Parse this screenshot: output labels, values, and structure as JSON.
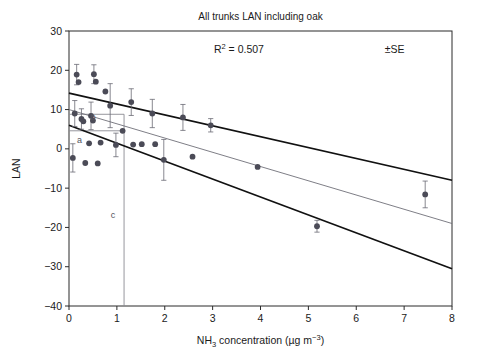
{
  "chart_data": {
    "type": "scatter",
    "title": "All trunks LAN including oak",
    "xlabel": "NH3 concentration (µg m-3)",
    "xlabel_parts": {
      "pre": "NH",
      "sub": "3",
      "mid": " concentration (µg m",
      "sup": "−3",
      "post": ")"
    },
    "ylabel": "LAN",
    "xlim": [
      0,
      8
    ],
    "ylim": [
      -40,
      30
    ],
    "xticks": [
      0,
      1,
      2,
      3,
      4,
      5,
      6,
      7,
      8
    ],
    "yticks": [
      -40,
      -30,
      -20,
      -10,
      0,
      10,
      20,
      30
    ],
    "xtick_labels": [
      "0",
      "1",
      "2",
      "3",
      "4",
      "5",
      "6",
      "7",
      "8"
    ],
    "ytick_labels": [
      "−40",
      "−30",
      "−20",
      "−10",
      "0",
      "10",
      "20",
      "30"
    ],
    "grid": false,
    "legend": false,
    "annotations": [
      {
        "name": "r-squared",
        "text": "R2 = 0.507",
        "text_pre": "R",
        "text_sup": "2",
        "text_post": "= 0.507",
        "x": 3.55,
        "y": 24.5
      },
      {
        "name": "se-note",
        "text": "±SE",
        "x": 6.8,
        "y": 24.5
      }
    ],
    "marker_labels": [
      {
        "name": "marker-a",
        "label": "a",
        "x": 0.22,
        "y": 1.6
      },
      {
        "name": "marker-b",
        "label": "b",
        "x": 0.5,
        "y": 7.3
      },
      {
        "name": "marker-c",
        "label": "c",
        "x": 0.92,
        "y": -17.5
      }
    ],
    "reference_lines": [
      {
        "name": "ref-line-a-horizontal",
        "kind": "horizontal",
        "y": 4.6,
        "x0": 0.0,
        "x1": 1.15,
        "color": "#8a8a92"
      },
      {
        "name": "ref-line-b-horizontal",
        "kind": "horizontal",
        "y": 8.8,
        "x0": 0.0,
        "x1": 1.15,
        "color": "#8a8a92"
      },
      {
        "name": "ref-line-c-vertical",
        "kind": "vertical",
        "x": 1.15,
        "y0": -40.0,
        "y1": 8.8,
        "color": "#8a8a92"
      }
    ],
    "fit_lines": [
      {
        "name": "upper-confidence-line",
        "style": "solid-thick",
        "color": "#111111",
        "x0": 0.0,
        "y0": 14.2,
        "x1": 8.0,
        "y1": -8.0
      },
      {
        "name": "regression-line",
        "style": "solid-thin",
        "color": "#6f6f78",
        "x0": 0.0,
        "y0": 10.0,
        "x1": 8.0,
        "y1": -19.0
      },
      {
        "name": "lower-confidence-line",
        "style": "solid-thick",
        "color": "#111111",
        "x0": 0.0,
        "y0": 6.0,
        "x1": 8.0,
        "y1": -30.5
      }
    ],
    "marker_color": "#4b4b57",
    "errorbar_color": "#6a6a74",
    "points": [
      {
        "x": 0.08,
        "y": -2.3,
        "err": 3.6
      },
      {
        "x": 0.12,
        "y": 9.0,
        "err": 3.3
      },
      {
        "x": 0.16,
        "y": 18.9,
        "err": 2.6
      },
      {
        "x": 0.2,
        "y": 17.0,
        "err": 0.0
      },
      {
        "x": 0.26,
        "y": 7.6,
        "err": 2.6
      },
      {
        "x": 0.3,
        "y": 7.0,
        "err": 0.0
      },
      {
        "x": 0.34,
        "y": -3.6,
        "err": 0.0
      },
      {
        "x": 0.42,
        "y": 1.4,
        "err": 0.0
      },
      {
        "x": 0.46,
        "y": 8.4,
        "err": 3.5
      },
      {
        "x": 0.5,
        "y": 7.2,
        "err": 0.0
      },
      {
        "x": 0.52,
        "y": 19.0,
        "err": 2.4
      },
      {
        "x": 0.56,
        "y": 17.1,
        "err": 0.0
      },
      {
        "x": 0.6,
        "y": -3.7,
        "err": 0.0
      },
      {
        "x": 0.66,
        "y": 1.6,
        "err": 0.0
      },
      {
        "x": 0.76,
        "y": 14.6,
        "err": 0.0
      },
      {
        "x": 0.86,
        "y": 11.0,
        "err": 5.6
      },
      {
        "x": 0.98,
        "y": 1.0,
        "err": 3.0
      },
      {
        "x": 1.12,
        "y": 4.6,
        "err": 0.0
      },
      {
        "x": 1.3,
        "y": 11.9,
        "err": 3.4
      },
      {
        "x": 1.34,
        "y": 1.1,
        "err": 0.0
      },
      {
        "x": 1.52,
        "y": 1.2,
        "err": 0.0
      },
      {
        "x": 1.74,
        "y": 9.0,
        "err": 3.6
      },
      {
        "x": 1.8,
        "y": 1.2,
        "err": 0.0
      },
      {
        "x": 1.98,
        "y": -2.8,
        "err": 5.2
      },
      {
        "x": 2.38,
        "y": 8.0,
        "err": 3.3
      },
      {
        "x": 2.58,
        "y": -2.0,
        "err": 0.0
      },
      {
        "x": 2.96,
        "y": 6.0,
        "err": 1.7
      },
      {
        "x": 3.94,
        "y": -4.6,
        "err": 0.0
      },
      {
        "x": 5.18,
        "y": -19.7,
        "err": 1.5
      },
      {
        "x": 7.44,
        "y": -11.6,
        "err": 3.4
      }
    ]
  }
}
